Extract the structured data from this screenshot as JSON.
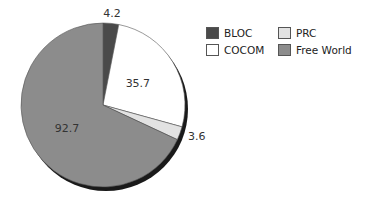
{
  "chart_data": {
    "type": "pie",
    "title": "",
    "categories": [
      "BLOC",
      "COCOM",
      "PRC",
      "Free World"
    ],
    "values": [
      4.2,
      35.7,
      3.6,
      92.7
    ],
    "colors": [
      "#4a4a4a",
      "#ffffff",
      "#e2e2e2",
      "#8c8c8c"
    ],
    "labels": [
      "4.2",
      "35.7",
      "3.6",
      "92.7"
    ],
    "legend_position": "right",
    "start_angle_deg": 0,
    "direction": "clockwise"
  },
  "legend": [
    {
      "name": "BLOC",
      "color": "#4a4a4a"
    },
    {
      "name": "PRC",
      "color": "#e2e2e2"
    },
    {
      "name": "COCOM",
      "color": "#ffffff"
    },
    {
      "name": "Free World",
      "color": "#8c8c8c"
    }
  ]
}
